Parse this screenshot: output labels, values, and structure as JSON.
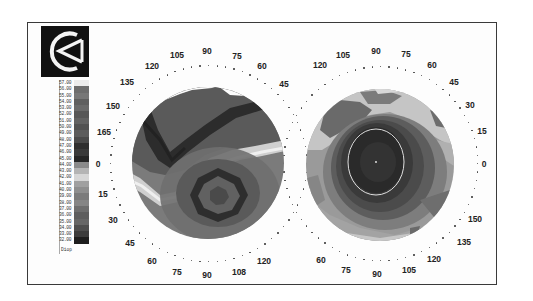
{
  "figure": {
    "logo": {
      "name": "instrument-logo",
      "glyph": "C with triangle"
    }
  },
  "legend": {
    "unit": "Diop",
    "entries": [
      {
        "value": "57.00",
        "color": "#ececec"
      },
      {
        "value": "56.00",
        "color": "#6d6d6d"
      },
      {
        "value": "55.00",
        "color": "#777777"
      },
      {
        "value": "54.00",
        "color": "#5f5f5f"
      },
      {
        "value": "53.00",
        "color": "#6a6a6a"
      },
      {
        "value": "52.00",
        "color": "#575757"
      },
      {
        "value": "51.00",
        "color": "#626262"
      },
      {
        "value": "50.00",
        "color": "#525252"
      },
      {
        "value": "49.00",
        "color": "#5c5c5c"
      },
      {
        "value": "48.00",
        "color": "#4a4a4a"
      },
      {
        "value": "47.00",
        "color": "#2f2f2f"
      },
      {
        "value": "46.00",
        "color": "#3a3a3a"
      },
      {
        "value": "45.00",
        "color": "#262626"
      },
      {
        "value": "44.00",
        "color": "#8a8a8a"
      },
      {
        "value": "43.00",
        "color": "#b4b4b4"
      },
      {
        "value": "42.00",
        "color": "#d6d6d6"
      },
      {
        "value": "41.00",
        "color": "#a0a0a0"
      },
      {
        "value": "40.00",
        "color": "#8e8e8e"
      },
      {
        "value": "39.00",
        "color": "#7b7b7b"
      },
      {
        "value": "38.00",
        "color": "#858585"
      },
      {
        "value": "37.00",
        "color": "#6e6e6e"
      },
      {
        "value": "36.00",
        "color": "#5e5e5e"
      },
      {
        "value": "35.00",
        "color": "#666666"
      },
      {
        "value": "34.00",
        "color": "#4e4e4e"
      },
      {
        "value": "33.00",
        "color": "#3c3c3c"
      },
      {
        "value": "32.00",
        "color": "#1e1e1e"
      }
    ]
  },
  "maps": [
    {
      "id": "left-map",
      "center": [
        208,
        163
      ],
      "radius": 76,
      "labels": [
        {
          "text": "90",
          "x": 207,
          "y": 51
        },
        {
          "text": "105",
          "x": 177,
          "y": 55
        },
        {
          "text": "120",
          "x": 152,
          "y": 66
        },
        {
          "text": "75",
          "x": 237,
          "y": 56
        },
        {
          "text": "60",
          "x": 262,
          "y": 66
        },
        {
          "text": "45",
          "x": 284,
          "y": 84
        },
        {
          "text": "135",
          "x": 127,
          "y": 82
        },
        {
          "text": "150",
          "x": 113,
          "y": 106
        },
        {
          "text": "165",
          "x": 104,
          "y": 132
        },
        {
          "text": "0",
          "x": 98,
          "y": 164
        },
        {
          "text": "15",
          "x": 103,
          "y": 194
        },
        {
          "text": "30",
          "x": 113,
          "y": 220
        },
        {
          "text": "45",
          "x": 130,
          "y": 243
        },
        {
          "text": "60",
          "x": 152,
          "y": 261
        },
        {
          "text": "75",
          "x": 177,
          "y": 272
        },
        {
          "text": "90",
          "x": 207,
          "y": 275
        },
        {
          "text": "108",
          "x": 239,
          "y": 272
        },
        {
          "text": "120",
          "x": 264,
          "y": 261
        }
      ]
    },
    {
      "id": "right-map",
      "center": [
        380,
        163
      ],
      "radius": 75,
      "labels": [
        {
          "text": "90",
          "x": 376,
          "y": 51
        },
        {
          "text": "105",
          "x": 343,
          "y": 55
        },
        {
          "text": "120",
          "x": 320,
          "y": 65
        },
        {
          "text": "75",
          "x": 406,
          "y": 54
        },
        {
          "text": "60",
          "x": 432,
          "y": 65
        },
        {
          "text": "45",
          "x": 454,
          "y": 82
        },
        {
          "text": "30",
          "x": 470,
          "y": 105
        },
        {
          "text": "15",
          "x": 482,
          "y": 131
        },
        {
          "text": "0",
          "x": 484,
          "y": 164
        },
        {
          "text": "150",
          "x": 475,
          "y": 219
        },
        {
          "text": "135",
          "x": 464,
          "y": 242
        },
        {
          "text": "120",
          "x": 434,
          "y": 259
        },
        {
          "text": "105",
          "x": 409,
          "y": 270
        },
        {
          "text": "90",
          "x": 377,
          "y": 274
        },
        {
          "text": "75",
          "x": 346,
          "y": 270
        },
        {
          "text": "60",
          "x": 321,
          "y": 260
        }
      ]
    }
  ],
  "colors": {
    "frame": "#3a3a3a",
    "background": "#fdfdfd",
    "right_map_ring": "#e8e8e8"
  }
}
